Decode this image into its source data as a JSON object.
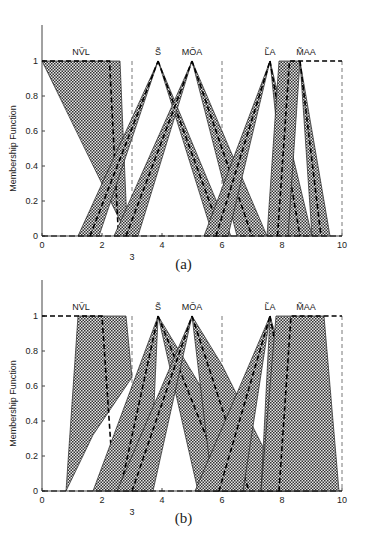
{
  "chart_data": [
    {
      "type": "area",
      "caption": "(a)",
      "title": "",
      "xlabel": "",
      "ylabel": "Membership Function",
      "xlim": [
        0,
        10
      ],
      "ylim": [
        0,
        1.2
      ],
      "xticks": [
        0,
        2,
        3,
        4,
        6,
        8,
        10
      ],
      "yticks": [
        0,
        0.2,
        0.4,
        0.6,
        0.8,
        1
      ],
      "vlines_dashed": [
        3,
        6,
        10
      ],
      "grid": false,
      "legend": null,
      "series": [
        {
          "name": "NVL",
          "label_x": 1.3,
          "bands": [
            {
              "outer": [
                [
                  0,
                  1
                ],
                [
                  2.6,
                  1
                ],
                [
                  2.85,
                  0
                ]
              ],
              "inner": [
                [
                  1.95,
                  1
                ],
                [
                  2.3,
                  0
                ]
              ],
              "mid": [
                [
                  0,
                  1
                ],
                [
                  2.25,
                  1
                ],
                [
                  2.55,
                  0
                ]
              ]
            }
          ]
        },
        {
          "name": "S",
          "label_x": 3.87,
          "peak": 3.87,
          "bands": [
            {
              "outer": [
                [
                  1.2,
                  0
                ],
                [
                  3.87,
                  1
                ],
                [
                  1.9,
                  0
                ]
              ],
              "mid": [
                [
                  1.6,
                  0
                ],
                [
                  3.87,
                  1
                ]
              ]
            },
            {
              "outer": [
                [
                  3.87,
                  1
                ],
                [
                  5.7,
                  0
                ],
                [
                  6.3,
                  0
                ]
              ],
              "mid": [
                [
                  3.87,
                  1
                ],
                [
                  6.0,
                  0
                ]
              ]
            }
          ]
        },
        {
          "name": "MOA",
          "label_x": 5.0,
          "peak": 5.0,
          "bands": [
            {
              "outer": [
                [
                  2.4,
                  0
                ],
                [
                  5.0,
                  1
                ],
                [
                  3.2,
                  0
                ]
              ],
              "mid": [
                [
                  2.8,
                  0
                ],
                [
                  5.0,
                  1
                ]
              ]
            },
            {
              "outer": [
                [
                  5.0,
                  1
                ],
                [
                  6.5,
                  0
                ],
                [
                  7.5,
                  0
                ]
              ],
              "mid": [
                [
                  5.0,
                  1
                ],
                [
                  7.0,
                  0
                ]
              ]
            }
          ]
        },
        {
          "name": "LA",
          "label_x": 7.6,
          "peak": 7.6,
          "bands": [
            {
              "outer": [
                [
                  5.4,
                  0
                ],
                [
                  7.6,
                  1
                ],
                [
                  6.2,
                  0
                ]
              ],
              "mid": [
                [
                  5.8,
                  0
                ],
                [
                  7.6,
                  1
                ]
              ]
            },
            {
              "outer": [
                [
                  7.6,
                  1
                ],
                [
                  8.2,
                  0
                ],
                [
                  9.0,
                  0
                ]
              ],
              "mid": [
                [
                  7.6,
                  1
                ],
                [
                  8.6,
                  0
                ]
              ]
            }
          ]
        },
        {
          "name": "MAA",
          "label_x": 8.8,
          "bands": [
            {
              "outer": [
                [
                  7.5,
                  0
                ],
                [
                  7.9,
                  1
                ],
                [
                  8.6,
                  1
                ],
                [
                  8.2,
                  0
                ]
              ],
              "mid": [
                [
                  7.85,
                  0
                ],
                [
                  8.25,
                  1
                ],
                [
                  10,
                  1
                ]
              ]
            },
            {
              "outer": [
                [
                  8.6,
                  1
                ],
                [
                  9.0,
                  0
                ],
                [
                  9.6,
                  0
                ]
              ],
              "mid": [
                [
                  8.6,
                  1
                ],
                [
                  9.3,
                  0
                ]
              ]
            }
          ]
        }
      ]
    },
    {
      "type": "area",
      "caption": "(b)",
      "title": "",
      "xlabel": "",
      "ylabel": "Membership Function",
      "xlim": [
        0,
        10
      ],
      "ylim": [
        0,
        1.2
      ],
      "xticks": [
        0,
        2,
        3,
        4,
        6,
        8,
        10
      ],
      "yticks": [
        0,
        0.2,
        0.4,
        0.6,
        0.8,
        1
      ],
      "vlines_dashed": [
        3,
        6,
        10
      ],
      "grid": false,
      "legend": null,
      "series": [
        {
          "name": "NVL",
          "label_x": 1.3,
          "bands": [
            {
              "outer": [
                [
                  1.2,
                  1
                ],
                [
                  2.8,
                  1
                ],
                [
                  3.0,
                  0.65
                ],
                [
                  1.7,
                  0.32
                ],
                [
                  0.8,
                  0
                ]
              ],
              "mid": [
                [
                  0,
                  1
                ],
                [
                  2.0,
                  1
                ],
                [
                  2.4,
                  0
                ]
              ]
            }
          ]
        },
        {
          "name": "S",
          "label_x": 3.87,
          "peak": 3.87,
          "bands": [
            {
              "outer": [
                [
                  1.7,
                  0
                ],
                [
                  3.87,
                  1
                ],
                [
                  3.6,
                  0
                ]
              ],
              "mid": [
                [
                  2.6,
                  0
                ],
                [
                  3.87,
                  1
                ]
              ]
            },
            {
              "outer": [
                [
                  3.87,
                  1
                ],
                [
                  5.2,
                  0
                ],
                [
                  7.4,
                  0
                ]
              ],
              "mid": [
                [
                  3.87,
                  1
                ],
                [
                  6.2,
                  0
                ]
              ]
            }
          ]
        },
        {
          "name": "MOA",
          "label_x": 5.0,
          "peak": 5.0,
          "bands": [
            {
              "outer": [
                [
                  2.5,
                  0
                ],
                [
                  5.0,
                  1
                ],
                [
                  3.7,
                  0
                ]
              ],
              "mid": [
                [
                  3.0,
                  0
                ],
                [
                  5.0,
                  1
                ]
              ]
            },
            {
              "outer": [
                [
                  5.0,
                  1
                ],
                [
                  5.7,
                  0
                ],
                [
                  8.1,
                  0
                ],
                [
                  6.0,
                  0.72
                ]
              ],
              "mid": [
                [
                  5.0,
                  1
                ],
                [
                  6.9,
                  0
                ]
              ]
            }
          ]
        },
        {
          "name": "LA",
          "label_x": 7.6,
          "peak": 7.6,
          "bands": [
            {
              "outer": [
                [
                  5.1,
                  0
                ],
                [
                  7.6,
                  1
                ],
                [
                  6.7,
                  0
                ]
              ],
              "mid": [
                [
                  5.9,
                  0
                ],
                [
                  7.6,
                  1
                ]
              ]
            },
            {
              "outer": [
                [
                  7.6,
                  1
                ],
                [
                  7.3,
                  0
                ],
                [
                  9.3,
                  0
                ]
              ],
              "mid": [
                [
                  7.6,
                  1
                ],
                [
                  8.7,
                  0
                ]
              ]
            }
          ]
        },
        {
          "name": "MAA",
          "label_x": 8.8,
          "bands": [
            {
              "outer": [
                [
                  7.3,
                  0
                ],
                [
                  7.8,
                  1
                ],
                [
                  9.4,
                  1
                ],
                [
                  9.9,
                  0
                ],
                [
                  8.6,
                  0
                ]
              ],
              "mid": [
                [
                  7.9,
                  0
                ],
                [
                  8.3,
                  1
                ],
                [
                  10,
                  1
                ]
              ]
            }
          ]
        }
      ]
    }
  ],
  "figure": {
    "ylabel": "Membership Function",
    "caption_a": "(a)",
    "caption_b": "(b)",
    "labels": {
      "nvl": "NṼL",
      "s": "S̃",
      "moa": "MÕA",
      "la": "L̃A",
      "maa": "M̃AA"
    }
  }
}
